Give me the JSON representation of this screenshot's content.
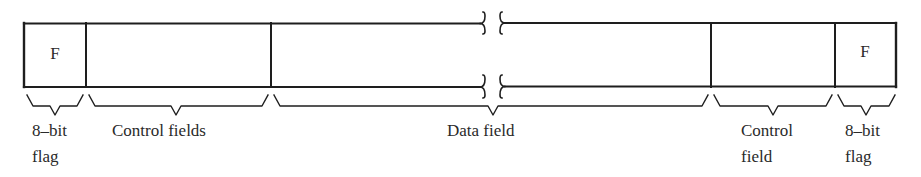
{
  "figure": {
    "stroke_color": "#1e1e1e",
    "background_color": "#ffffff"
  },
  "frame": {
    "fields": [
      {
        "id": "flag-start",
        "content": "F",
        "label_line1": "8-bit",
        "label_line2": "flag"
      },
      {
        "id": "control-fields-start",
        "content": "",
        "label_line1": "Control fields",
        "label_line2": ""
      },
      {
        "id": "data-field",
        "content": "",
        "label_line1": "Data field",
        "label_line2": ""
      },
      {
        "id": "control-field-end",
        "content": "",
        "label_line1": "Control",
        "label_line2": "field"
      },
      {
        "id": "flag-end",
        "content": "F",
        "label_line1": "8-bit",
        "label_line2": "flag"
      }
    ]
  },
  "labels": {
    "flag_start_line1": "8–bit",
    "flag_start_line2": "flag",
    "control_fields": "Control fields",
    "data_field": "Data field",
    "control_field_line1": "Control",
    "control_field_line2": "field",
    "flag_end_line1": "8–bit",
    "flag_end_line2": "flag",
    "flag_start_letter": "F",
    "flag_end_letter": "F"
  }
}
